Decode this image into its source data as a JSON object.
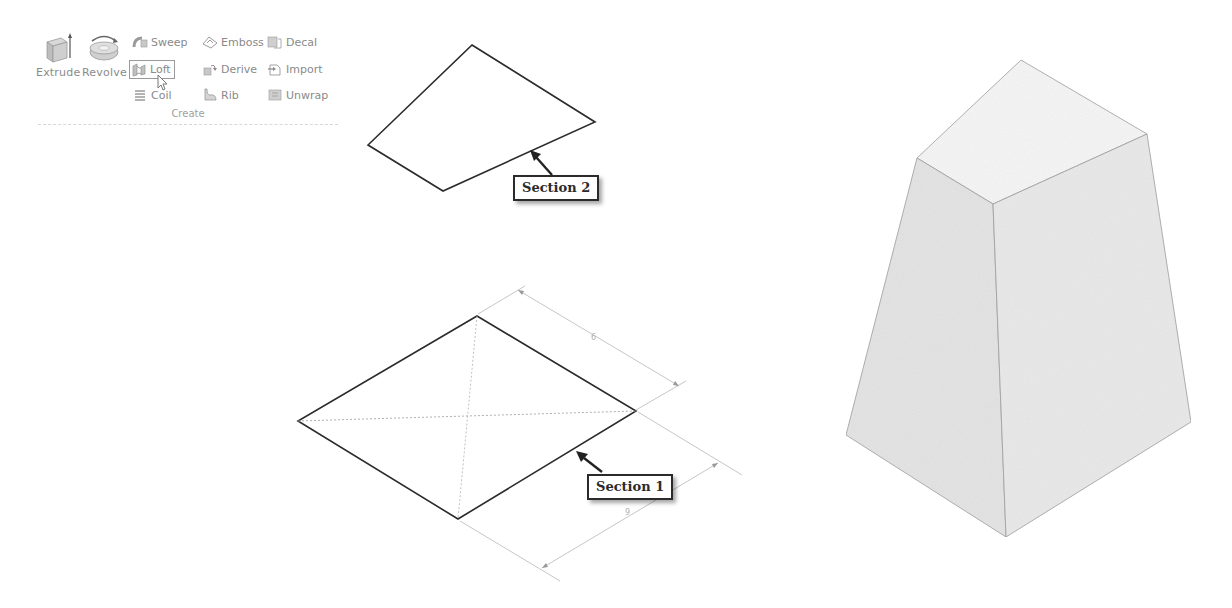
{
  "ribbon": {
    "group_label": "Create",
    "big_buttons": [
      {
        "id": "extrude",
        "label": "Extrude",
        "icon": "extrude-icon"
      },
      {
        "id": "revolve",
        "label": "Revolve",
        "icon": "revolve-icon"
      }
    ],
    "small_buttons": [
      {
        "id": "sweep",
        "label": "Sweep",
        "icon": "sweep-icon"
      },
      {
        "id": "loft",
        "label": "Loft",
        "icon": "loft-icon",
        "selected": true
      },
      {
        "id": "coil",
        "label": "Coil",
        "icon": "coil-icon"
      },
      {
        "id": "emboss",
        "label": "Emboss",
        "icon": "emboss-icon"
      },
      {
        "id": "derive",
        "label": "Derive",
        "icon": "derive-icon"
      },
      {
        "id": "rib",
        "label": "Rib",
        "icon": "rib-icon"
      },
      {
        "id": "decal",
        "label": "Decal",
        "icon": "decal-icon"
      },
      {
        "id": "import",
        "label": "Import",
        "icon": "import-icon"
      },
      {
        "id": "unwrap",
        "label": "Unwrap",
        "icon": "unwrap-icon"
      }
    ]
  },
  "callouts": {
    "section2": "Section 2",
    "section1": "Section 1"
  },
  "dimensions": {
    "top_edge": "6",
    "bottom_edge": "9"
  },
  "colors": {
    "line": "#2b2b2b",
    "dim_line": "#b8b8b8",
    "solid_left_face": "#e4e4e4",
    "solid_right_face": "#e9e9e9",
    "solid_top_face": "#f6f6f6"
  }
}
